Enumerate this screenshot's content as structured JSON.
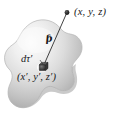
{
  "figure": {
    "background_color": "#ffffff",
    "width": 120,
    "height": 124,
    "blob": {
      "name": "source-charge-distribution",
      "fill_light": "#f4f4f4",
      "fill_mid": "#d8d8d8",
      "fill_dark": "#9b9b9b",
      "outline_color": "#b9b9b9"
    },
    "vector": {
      "name": "separation-vector",
      "symbol": "ℓ",
      "script_r_label": "r",
      "line_color": "#2a2a2a",
      "from": "source-point",
      "to": "field-point"
    },
    "labels": {
      "field_point": "(x, y, z)",
      "volume_element": "dτ′",
      "source_point": "(x′, y′, z′)",
      "separation_symbol": "ƥ"
    },
    "markers": {
      "field_point_dot_color": "#1a1a1a",
      "volume_element_cube_color": "#3a3a3a"
    }
  }
}
